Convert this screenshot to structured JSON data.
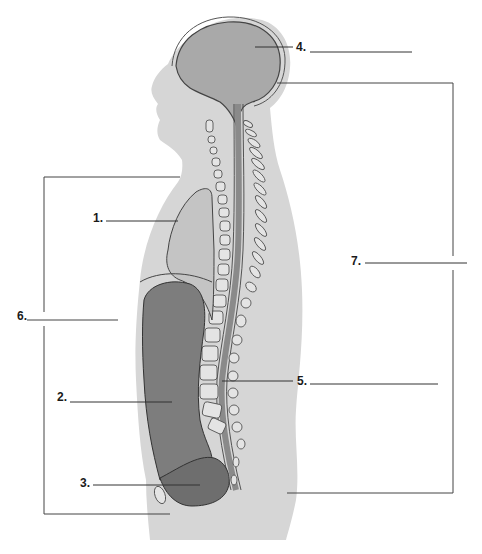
{
  "diagram": {
    "type": "anatomical-label-worksheet",
    "colors": {
      "body_fill": "#d6d6d6",
      "brain_fill": "#a8a8a8",
      "organ_dark": "#7a7a7a",
      "lung_fill": "#c2c2c2",
      "line": "#444444",
      "text": "#1a1a1a"
    },
    "labels": [
      {
        "id": "1",
        "text": "1.",
        "answer": "",
        "points_to": "thoracic cavity (lung region)"
      },
      {
        "id": "2",
        "text": "2.",
        "answer": "",
        "points_to": "abdominal cavity"
      },
      {
        "id": "3",
        "text": "3.",
        "answer": "",
        "points_to": "pelvic cavity"
      },
      {
        "id": "4",
        "text": "4.",
        "answer": "",
        "points_to": "cranial cavity"
      },
      {
        "id": "5",
        "text": "5.",
        "answer": "",
        "points_to": "vertebral (spinal) cavity"
      },
      {
        "id": "6",
        "text": "6.",
        "answer": "",
        "points_to": "bracket spanning thoracic to pelvic cavities"
      },
      {
        "id": "7",
        "text": "7.",
        "answer": "",
        "points_to": "bracket spanning cranial and vertebral cavities"
      }
    ]
  }
}
